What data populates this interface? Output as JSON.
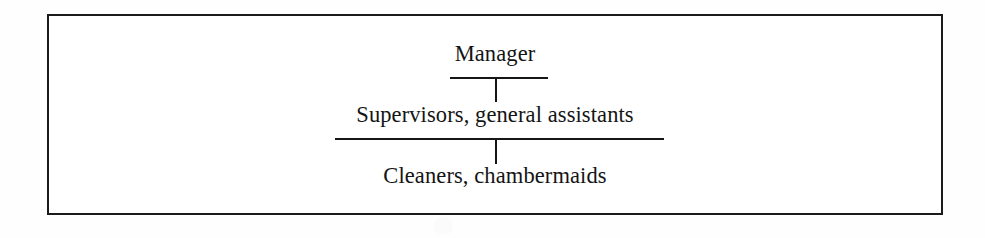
{
  "figure": {
    "kind": "organisational-hierarchy-chart",
    "orientation": "top-down",
    "tier_count": 3,
    "colors": {
      "ink": "#141414",
      "rule": "#161616",
      "frame": "#1b1b1b",
      "paper": "#ffffff"
    },
    "tiers": [
      {
        "level": 1,
        "label": "Manager",
        "has_rule_below": true,
        "has_stem_below": true
      },
      {
        "level": 2,
        "label": "Supervisors, general assistants",
        "has_rule_below": true,
        "has_stem_below": true
      },
      {
        "level": 3,
        "label": "Cleaners, chambermaids",
        "has_rule_below": false,
        "has_stem_below": false
      }
    ]
  }
}
